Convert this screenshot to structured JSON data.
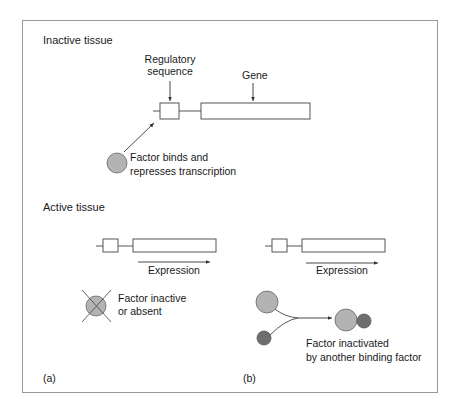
{
  "figure": {
    "sections": {
      "inactive": {
        "title": "Inactive tissue",
        "regulatory_label_line1": "Regulatory",
        "regulatory_label_line2": "sequence",
        "gene_label": "Gene",
        "factor_label_line1": "Factor binds and",
        "factor_label_line2": "represses transcription"
      },
      "active": {
        "title": "Active tissue",
        "panel_a": {
          "expression_label": "Expression",
          "factor_label_line1": "Factor inactive",
          "factor_label_line2": "or absent",
          "panel_label": "(a)"
        },
        "panel_b": {
          "expression_label": "Expression",
          "factor_label_line1": "Factor inactivated",
          "factor_label_line2": "by another binding factor",
          "panel_label": "(b)"
        }
      }
    },
    "colors": {
      "frame": "#9a9a9a",
      "line": "#333333",
      "factor_fill": "#b3b3b3",
      "binding_factor_fill": "#6e6e6e",
      "box_fill": "#ffffff"
    }
  }
}
